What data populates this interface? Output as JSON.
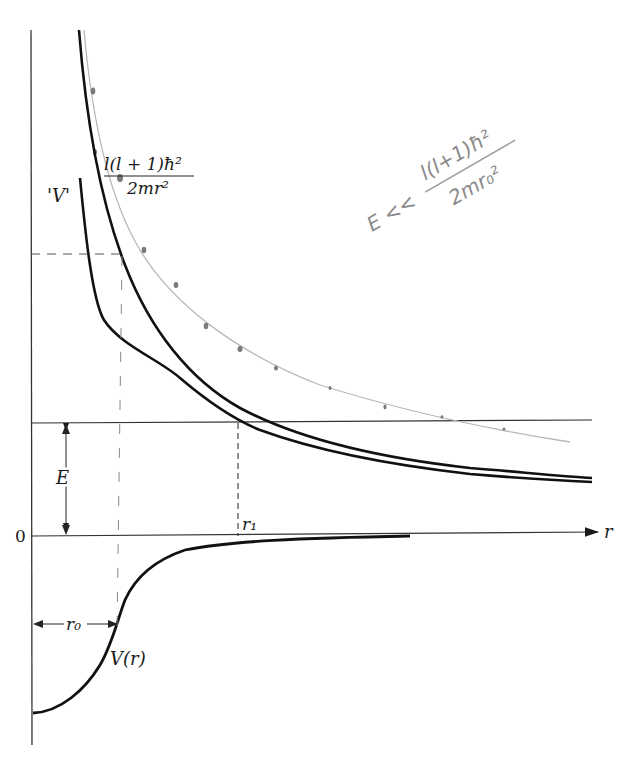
{
  "figure": {
    "labels": {
      "centrifugal_numerator": "l(l + 1)ħ²",
      "centrifugal_denominator": "2mr²",
      "effective_potential": "'V'",
      "energy": "E",
      "zero": "0",
      "r_axis": "r",
      "r1": "r₁",
      "r0": "r₀",
      "potential": "V(r)"
    },
    "handwritten_note": {
      "prefix": "E << ",
      "numerator": "l(l+1)ħ²",
      "denominator": "2mr₀²"
    },
    "colors": {
      "ink": "#1a1a1a",
      "pencil": "#9a9a9a"
    },
    "curves": [
      {
        "name": "centrifugal-term",
        "formula": "l(l+1)ħ²/2mr²",
        "style": "solid"
      },
      {
        "name": "effective-potential",
        "formula": "V(r) + l(l+1)ħ²/2mr²",
        "style": "solid"
      },
      {
        "name": "potential-well",
        "formula": "V(r)",
        "style": "solid"
      },
      {
        "name": "pencil-sketch",
        "formula": "hand-drawn dotted curve",
        "style": "pencil"
      }
    ]
  }
}
